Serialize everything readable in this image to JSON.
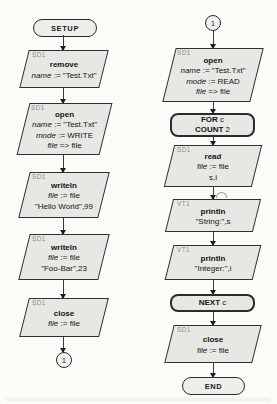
{
  "colors": {
    "background": "#fbfbf8",
    "shape_fill": "#e7e7e3",
    "shape_border": "#303030",
    "tag_text": "#8f8f8a",
    "body_text": "#141414"
  },
  "terminals": {
    "setup": "SETUP",
    "end": "END"
  },
  "connectors": {
    "left": "1",
    "right": "1"
  },
  "nodes": {
    "remove": {
      "tag": "SD1",
      "lines": [
        [
          {
            "t": "remove",
            "b": 1
          }
        ],
        [
          {
            "t": "name",
            "em": 1
          },
          {
            "t": " := \"Test.Txt\""
          }
        ]
      ]
    },
    "open_write": {
      "tag": "SD1",
      "lines": [
        [
          {
            "t": "open",
            "b": 1
          }
        ],
        [
          {
            "t": "name",
            "em": 1
          },
          {
            "t": " := \"Test.Txt\""
          }
        ],
        [
          {
            "t": "mode",
            "em": 1
          },
          {
            "t": " := WRITE"
          }
        ],
        [
          {
            "t": "file",
            "em": 1
          },
          {
            "t": " => file"
          }
        ]
      ]
    },
    "writeln_hello": {
      "tag": "SD1",
      "lines": [
        [
          {
            "t": "writeln",
            "b": 1
          }
        ],
        [
          {
            "t": "file",
            "em": 1
          },
          {
            "t": " := file"
          }
        ],
        [
          {
            "t": "\"Hello World\",99"
          }
        ]
      ]
    },
    "writeln_foobar": {
      "tag": "SD1",
      "lines": [
        [
          {
            "t": "writeln",
            "b": 1
          }
        ],
        [
          {
            "t": "file",
            "em": 1
          },
          {
            "t": " := file"
          }
        ],
        [
          {
            "t": "\"Foo-Bar\",23"
          }
        ]
      ]
    },
    "close_left": {
      "tag": "SD1",
      "lines": [
        [
          {
            "t": "close",
            "b": 1
          }
        ],
        [
          {
            "t": "file",
            "em": 1
          },
          {
            "t": " := file"
          }
        ]
      ]
    },
    "open_read": {
      "tag": "SD1",
      "lines": [
        [
          {
            "t": "open",
            "b": 1
          }
        ],
        [
          {
            "t": "name",
            "em": 1
          },
          {
            "t": " := \"Test.Txt\""
          }
        ],
        [
          {
            "t": "mode",
            "em": 1
          },
          {
            "t": " := READ"
          }
        ],
        [
          {
            "t": "file",
            "em": 1
          },
          {
            "t": " => file"
          }
        ]
      ]
    },
    "for_loop": {
      "lines": [
        [
          {
            "t": "FOR",
            "b": 1
          },
          {
            "t": " c"
          }
        ],
        [
          {
            "t": "COUNT",
            "b": 1
          },
          {
            "t": " 2"
          }
        ]
      ]
    },
    "read": {
      "tag": "SD1",
      "lines": [
        [
          {
            "t": "read",
            "b": 1
          }
        ],
        [
          {
            "t": "file",
            "em": 1
          },
          {
            "t": " := file"
          }
        ],
        [
          {
            "t": "s,i"
          }
        ]
      ]
    },
    "println_string": {
      "tag": "VT1",
      "lines": [
        [
          {
            "t": "println",
            "b": 1
          }
        ],
        [
          {
            "t": "\"String:\",s"
          }
        ]
      ]
    },
    "println_integer": {
      "tag": "VT1",
      "lines": [
        [
          {
            "t": "println",
            "b": 1
          }
        ],
        [
          {
            "t": "\"Integer:\",i"
          }
        ]
      ]
    },
    "next_loop": {
      "lines": [
        [
          {
            "t": "NEXT",
            "b": 1
          },
          {
            "t": " c"
          }
        ]
      ]
    },
    "close_right": {
      "tag": "SD1",
      "lines": [
        [
          {
            "t": "close",
            "b": 1
          }
        ],
        [
          {
            "t": "file",
            "em": 1
          },
          {
            "t": " := file"
          }
        ]
      ]
    }
  }
}
